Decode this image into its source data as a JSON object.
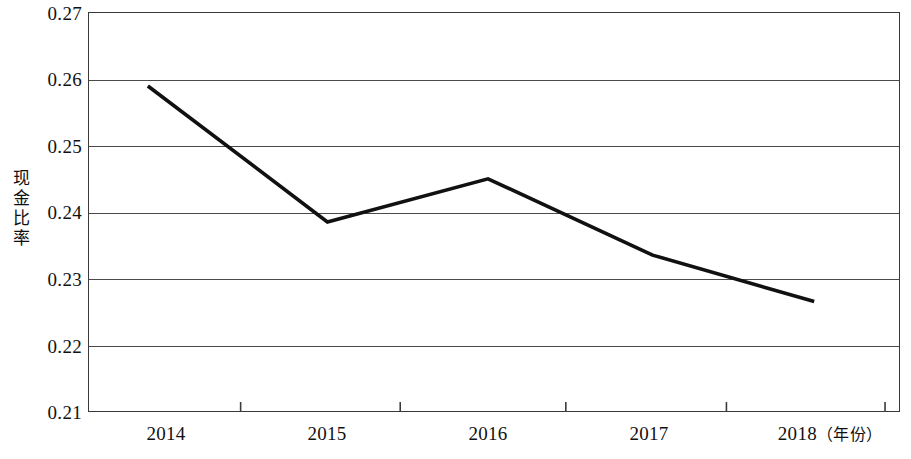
{
  "chart_data": {
    "type": "line",
    "title": "",
    "xlabel": "年份",
    "ylabel": "现金比率",
    "x": [
      "2014",
      "2015",
      "2016",
      "2017",
      "2018"
    ],
    "categories": [
      "2014",
      "2015",
      "2016",
      "2017",
      "2018"
    ],
    "values": [
      0.259,
      0.2385,
      0.245,
      0.2335,
      0.2265
    ],
    "series": [
      {
        "name": "现金比率",
        "values": [
          0.259,
          0.2385,
          0.245,
          0.2335,
          0.2265
        ]
      }
    ],
    "ylim": [
      0.21,
      0.27
    ],
    "ytick_labels": [
      "0.27",
      "0.26",
      "0.25",
      "0.24",
      "0.23",
      "0.22",
      "0.21"
    ],
    "ytick_values": [
      0.27,
      0.26,
      0.25,
      0.24,
      0.23,
      0.22,
      0.21
    ],
    "xtick_labels": [
      "2014",
      "2015",
      "2016",
      "2017",
      "2018"
    ],
    "x_unit_label": "（年份）",
    "grid": "horizontal",
    "legend": "none",
    "line_color": "#111111",
    "grid_color": "#4a4a4a",
    "axis_color": "#3a3a3a",
    "background": "#ffffff"
  },
  "axis": {
    "y_title": "现金比率",
    "y_title_chars": [
      "现",
      "金",
      "比",
      "率"
    ]
  }
}
